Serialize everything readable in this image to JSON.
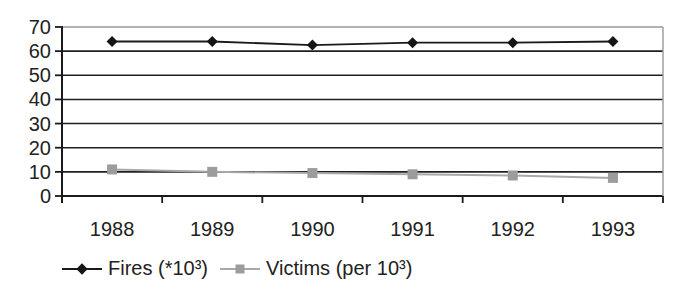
{
  "chart_data": {
    "type": "line",
    "title": "",
    "xlabel": "",
    "ylabel": "",
    "categories": [
      "1988",
      "1989",
      "1990",
      "1991",
      "1992",
      "1993"
    ],
    "series": [
      {
        "id": "fires",
        "name": "Fires (*10³)",
        "values": [
          64,
          64,
          62.5,
          63.5,
          63.5,
          64
        ],
        "line_color": "#1a1a1a",
        "line_width": 1.8,
        "marker": "diamond",
        "marker_color": "#151515"
      },
      {
        "id": "victims",
        "name": "Victims (per 10³)",
        "values": [
          11,
          10,
          9.5,
          9,
          8.5,
          7.5
        ],
        "line_color": "#a8a8a8",
        "line_width": 2,
        "marker": "square",
        "marker_color": "#9c9c9c"
      }
    ],
    "ylim": [
      0,
      70
    ],
    "yticks": [
      0,
      10,
      20,
      30,
      40,
      50,
      60,
      70
    ],
    "grid": true,
    "legend_position": "bottom-left",
    "colors": {
      "background": "#ffffff",
      "gridline": "#1f1f1f",
      "plot_border": "#999999",
      "axis": "#1a1a1a",
      "text": "#222222"
    }
  }
}
